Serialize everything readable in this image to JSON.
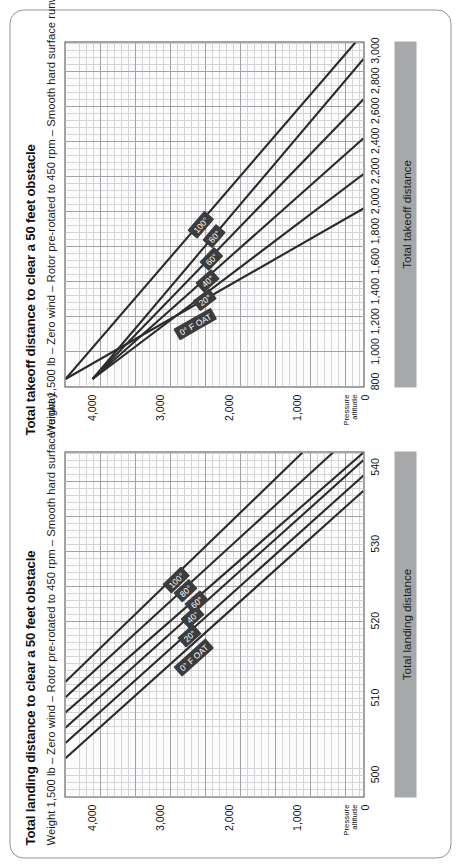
{
  "document": {
    "orientation_note": "landscape sheet shown rotated 90 degrees counter-clockwise"
  },
  "charts": [
    {
      "id": "landing",
      "title": "Total landing distance to clear a 50 feet obstacle",
      "subtitle": "Weight 1,500 lb – Zero wind – Rotor pre-rotated to 450 rpm – Smooth hard surface runway",
      "axis_bar_label": "Total landing distance",
      "y_axis_name_line1": "Pressure",
      "y_axis_name_line2": "altitude",
      "x_ticks": [
        "500",
        "510",
        "520",
        "530",
        "540"
      ],
      "y_ticks": [
        "0",
        "1,000",
        "2,000",
        "3,000",
        "4,000"
      ],
      "curve_labels": [
        "0° F OAT",
        "20°",
        "40°",
        "60°",
        "80°",
        "100°"
      ]
    },
    {
      "id": "takeoff",
      "title": "Total takeoff distance to clear a 50 feet obstacle",
      "subtitle": "Weight 1,500 lb – Zero wind – Rotor pre-rotated to 450 rpm – Smooth hard surface runway",
      "axis_bar_label": "Total takeoff distance",
      "y_axis_name_line1": "Pressure",
      "y_axis_name_line2": "altitude",
      "x_ticks": [
        "800",
        "1,000",
        "1,200",
        "1,400",
        "1,600",
        "1,800",
        "2,000",
        "2,200",
        "2,400",
        "2,600",
        "2,800",
        "3,000"
      ],
      "y_ticks": [
        "0",
        "1,000",
        "2,000",
        "3,000",
        "4,000"
      ],
      "curve_labels": [
        "0° F OAT",
        "20°",
        "40°",
        "60°",
        "80°",
        "100°"
      ]
    }
  ],
  "colors": {
    "curve": "#2b2b2b",
    "grid_minor": "#d3d5d8",
    "grid_major": "#9fa3a7",
    "axis_bar": "#a6a8aa",
    "label_chip": "#3c3c3c",
    "frame": "#8f9194"
  },
  "chart_data": [
    {
      "type": "line",
      "id": "landing",
      "title": "Total landing distance to clear a 50 feet obstacle",
      "subtitle": "Weight 1,500 lb – Zero wind – Rotor pre-rotated to 450 rpm – Smooth hard surface runway",
      "xlabel": "Total landing distance",
      "ylabel": "Pressure altitude",
      "xlim": [
        497,
        542
      ],
      "ylim": [
        0,
        4400
      ],
      "grid": true,
      "legend": "inline curve labels",
      "x": [
        500,
        510,
        520,
        530,
        540
      ],
      "series": [
        {
          "name": "0° F OAT",
          "x": [
            502,
            537
          ],
          "values": [
            4400,
            0
          ]
        },
        {
          "name": "20°",
          "x": [
            504,
            539
          ],
          "values": [
            4400,
            0
          ]
        },
        {
          "name": "40°",
          "x": [
            506,
            541
          ],
          "values": [
            4400,
            0
          ]
        },
        {
          "name": "60°",
          "x": [
            508,
            542
          ],
          "values": [
            4400,
            0
          ]
        },
        {
          "name": "80°",
          "x": [
            510,
            542
          ],
          "values": [
            4400,
            450
          ]
        },
        {
          "name": "100°",
          "x": [
            512,
            542
          ],
          "values": [
            4400,
            900
          ]
        }
      ]
    },
    {
      "type": "line",
      "id": "takeoff",
      "title": "Total takeoff distance to clear a 50 feet obstacle",
      "subtitle": "Weight 1,500 lb – Zero wind – Rotor pre-rotated to 450 rpm – Smooth hard surface runway",
      "xlabel": "Total takeoff distance",
      "ylabel": "Pressure altitude",
      "xlim": [
        760,
        3060
      ],
      "ylim": [
        0,
        4400
      ],
      "grid": true,
      "legend": "inline curve labels",
      "x": [
        800,
        1000,
        1200,
        1400,
        1600,
        1800,
        2000,
        2200,
        2400,
        2600,
        2800,
        3000
      ],
      "series": [
        {
          "name": "0° F OAT",
          "x": [
            810,
            1950
          ],
          "values": [
            4400,
            0
          ]
        },
        {
          "name": "20°",
          "x": [
            810,
            2180
          ],
          "values": [
            4000,
            0
          ]
        },
        {
          "name": "40°",
          "x": [
            810,
            2420
          ],
          "values": [
            4000,
            0
          ]
        },
        {
          "name": "60°",
          "x": [
            810,
            2680
          ],
          "values": [
            4000,
            0
          ]
        },
        {
          "name": "80°",
          "x": [
            810,
            2950
          ],
          "values": [
            4000,
            0
          ]
        },
        {
          "name": "100°",
          "x": [
            810,
            3060
          ],
          "values": [
            4400,
            120
          ]
        }
      ]
    }
  ]
}
